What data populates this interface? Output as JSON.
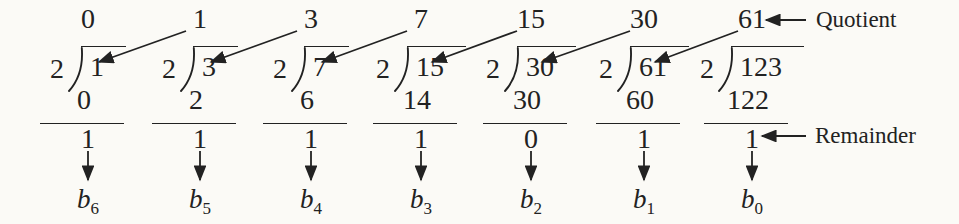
{
  "labels": {
    "quotient": "Quotient",
    "remainder": "Remainder"
  },
  "columns": [
    {
      "quotient": "0",
      "divisor": "2",
      "dividend": "1",
      "product": "0",
      "remainder": "1",
      "bit_base": "b",
      "bit_index": "6"
    },
    {
      "quotient": "1",
      "divisor": "2",
      "dividend": "3",
      "product": "2",
      "remainder": "1",
      "bit_base": "b",
      "bit_index": "5"
    },
    {
      "quotient": "3",
      "divisor": "2",
      "dividend": "7",
      "product": "6",
      "remainder": "1",
      "bit_base": "b",
      "bit_index": "4"
    },
    {
      "quotient": "7",
      "divisor": "2",
      "dividend": "15",
      "product": "14",
      "remainder": "1",
      "bit_base": "b",
      "bit_index": "3"
    },
    {
      "quotient": "15",
      "divisor": "2",
      "dividend": "30",
      "product": "30",
      "remainder": "0",
      "bit_base": "b",
      "bit_index": "2"
    },
    {
      "quotient": "30",
      "divisor": "2",
      "dividend": "61",
      "product": "60",
      "remainder": "1",
      "bit_base": "b",
      "bit_index": "1"
    },
    {
      "quotient": "61",
      "divisor": "2",
      "dividend": "123",
      "product": "122",
      "remainder": "1",
      "bit_base": "b",
      "bit_index": "0"
    }
  ],
  "colors": {
    "ink": "#222222",
    "paper": "#fbfaf6"
  }
}
